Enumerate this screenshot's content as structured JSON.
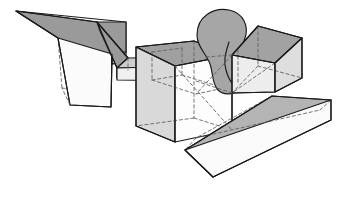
{
  "figure": {
    "background_color": "#ffffff",
    "width": 346,
    "height": 200,
    "line_style": {
      "visible_edge_color": "#1a1a1a",
      "visible_edge_width": 1.15,
      "hidden_edge_color": "#5e5e5e",
      "hidden_edge_width": 0.85,
      "hidden_edge_dash": "3.2 2.6"
    },
    "palette": {
      "face_top_dark": "#9a9a9a",
      "face_top_mid": "#b5b5b5",
      "face_side_light": "#e8e8e8",
      "face_front_white": "#fcfcfc",
      "face_side_mid": "#d2d2d2",
      "face_dome": "#a8a8a8",
      "outline": "#1a1a1a"
    },
    "shapes": [
      {
        "name": "left-wedge",
        "kind": "wedge",
        "description": "Large tapered wedge at upper left with shaded top band and white front faces",
        "faces": [
          {
            "name": "wedge-top-band",
            "fill": "#9a9a9a",
            "points": "16,11 97,22 126,51 106,53 58,38"
          },
          {
            "name": "wedge-left-front",
            "fill": "#fbfbfb",
            "points": "16,11 58,38 70,105 111,107 106,53 126,51 126,22"
          },
          {
            "name": "wedge-right-step",
            "fill": "#ffffff",
            "points": "106,53 111,107 118,99 118,47"
          }
        ]
      },
      {
        "name": "wedge-spur",
        "kind": "small-wedge",
        "description": "Small shaded spur wedge attached to right side of the left wedge",
        "faces": [
          {
            "name": "spur-top",
            "fill": "#9a9a9a",
            "points": "97,22 128,58 115,66 97,40"
          },
          {
            "name": "spur-face",
            "fill": "#b2b2b2",
            "points": "128,58 128,66 115,74 115,66"
          }
        ]
      },
      {
        "name": "connector-bar",
        "kind": "bar",
        "description": "Horizontal translucent bar linking the left wedge to the central box",
        "faces": [
          {
            "name": "bar-top",
            "fill": "#cfcfcf",
            "points": "118,66 196,66 206,56 128,56"
          },
          {
            "name": "bar-front",
            "fill": "#efefef",
            "points": "118,66 196,66 196,80 118,80"
          }
        ]
      },
      {
        "name": "center-box",
        "kind": "box",
        "description": "Large open cube in the middle with grey top face and white front faces",
        "faces": [
          {
            "name": "center-box-top",
            "fill": "#a0a0a0",
            "points": "136,47 194,41 232,55 175,66"
          },
          {
            "name": "center-box-left",
            "fill": "#d8d8d8",
            "points": "136,47 175,66 175,142 136,126"
          },
          {
            "name": "center-box-front",
            "fill": "#fdfdfd",
            "points": "175,66 232,55 232,130 175,142"
          }
        ]
      },
      {
        "name": "dome",
        "kind": "dome",
        "description": "Shaded rounded dome / ellipsoid behind the right box",
        "faces": [
          {
            "name": "dome-body",
            "fill": "#a6a6a6",
            "points": ""
          }
        ]
      },
      {
        "name": "right-box",
        "kind": "box",
        "description": "Small open cube at upper right with shaded top and light front faces",
        "faces": [
          {
            "name": "right-box-top",
            "fill": "#a2a2a2",
            "points": "232,55 258,26 302,38 275,62"
          },
          {
            "name": "right-box-left",
            "fill": "#ececec",
            "points": "232,55 275,62 275,92 232,93"
          },
          {
            "name": "right-box-front",
            "fill": "#dcdcdc",
            "points": "275,62 302,38 302,78 275,92"
          }
        ]
      },
      {
        "name": "base-slab",
        "kind": "slab",
        "description": "Flat rectangular plate in the lower right with thick grey top and white edge band",
        "faces": [
          {
            "name": "slab-top",
            "fill": "#b4b4b4",
            "points": "185,150 272,96 330,100 213,176"
          },
          {
            "name": "slab-front",
            "fill": "#fafafa",
            "points": "185,150 213,176 330,120 330,100"
          }
        ]
      }
    ],
    "hidden_edge_count": 34,
    "visible_shape_count": 7
  }
}
